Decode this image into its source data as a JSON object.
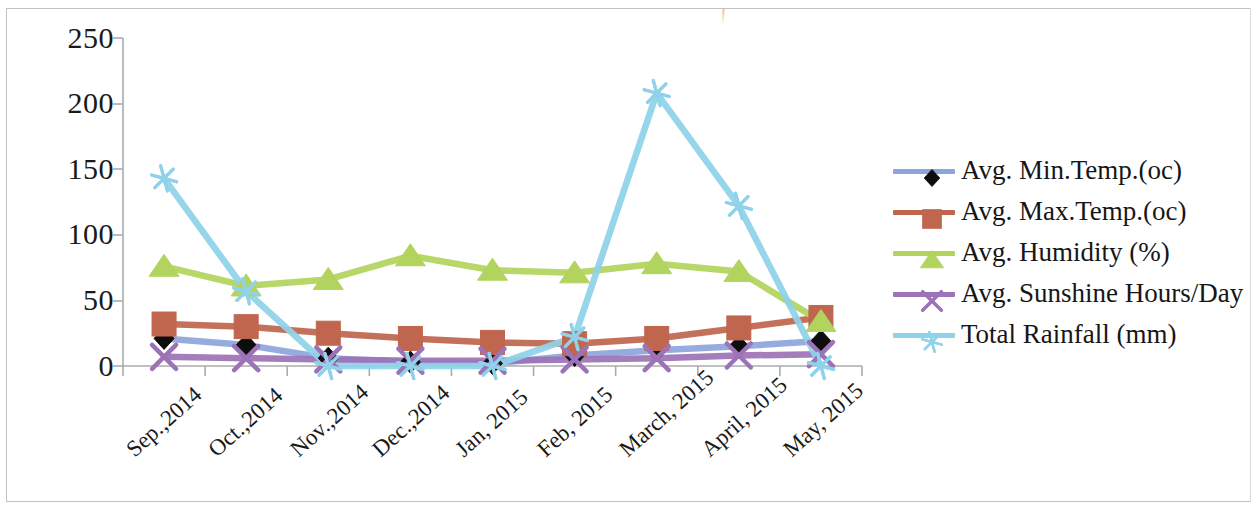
{
  "chart_data": {
    "type": "line",
    "title": "",
    "xlabel": "",
    "ylabel": "",
    "ylim": [
      0,
      250
    ],
    "yticks": [
      "0",
      "50",
      "100",
      "150",
      "200",
      "250"
    ],
    "grid": false,
    "legend_position": "right",
    "categories": [
      "Sep.,2014",
      "Oct.,2014",
      "Nov.,2014",
      "Dec.,2014",
      "Jan, 2015",
      "Feb, 2015",
      "March, 2015",
      "April, 2015",
      "May, 2015"
    ],
    "series": [
      {
        "name": "Avg. Min.Temp.(oc)",
        "color": "#8ea5dc",
        "marker": "diamond",
        "marker_color": "#0d0d0d",
        "values": [
          21,
          16,
          6,
          3,
          2,
          8,
          12,
          15,
          19
        ]
      },
      {
        "name": "Avg. Max.Temp.(oc)",
        "color": "#c0664f",
        "marker": "square",
        "marker_color": "#c0664f",
        "values": [
          32,
          30,
          25,
          21,
          18,
          17,
          21,
          29,
          37
        ]
      },
      {
        "name": "Avg. Humidity (%)",
        "color": "#b2d45e",
        "marker": "triangle",
        "marker_color": "#b2d45e",
        "values": [
          76,
          61,
          66,
          84,
          73,
          71,
          78,
          72,
          34
        ]
      },
      {
        "name": "Avg. Sunshine Hours/Day",
        "color": "#9d73b8",
        "marker": "cross",
        "marker_color": "#9d73b8",
        "values": [
          7,
          6,
          5,
          4,
          4,
          5,
          6,
          8,
          9
        ]
      },
      {
        "name": "Total Rainfall (mm)",
        "color": "#8fd2ea",
        "marker": "asterisk",
        "marker_color": "#8fd2ea",
        "values": [
          143,
          57,
          0,
          0,
          0,
          22,
          208,
          122,
          0
        ]
      }
    ]
  },
  "axis": {
    "y_tick_labels": [
      "250",
      "200",
      "150",
      "100",
      "50",
      "0"
    ]
  },
  "legend": {
    "items": [
      {
        "label": "Avg. Min.Temp.(oc)"
      },
      {
        "label": "Avg. Max.Temp.(oc)"
      },
      {
        "label": "Avg. Humidity (%)"
      },
      {
        "label": "Avg. Sunshine Hours/Day"
      },
      {
        "label": "Total Rainfall (mm)"
      }
    ]
  }
}
